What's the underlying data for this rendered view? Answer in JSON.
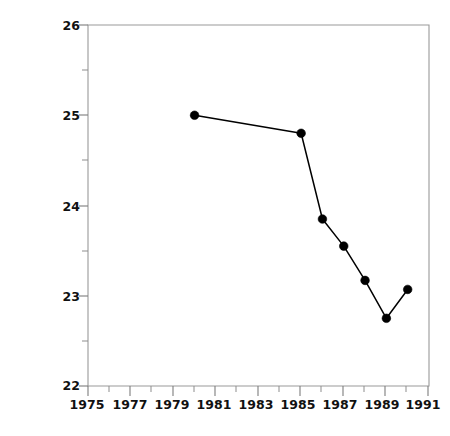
{
  "chart_data": {
    "type": "line",
    "title": "",
    "xlabel": "",
    "ylabel": "Reading test score",
    "x": [
      1980,
      1985,
      1986,
      1987,
      1988,
      1989,
      1990
    ],
    "values": [
      25.0,
      24.8,
      23.85,
      23.55,
      23.17,
      22.75,
      23.07
    ],
    "series": [
      {
        "name": "Reading test score",
        "values": [
          25.0,
          24.8,
          23.85,
          23.55,
          23.17,
          22.75,
          23.07
        ]
      }
    ],
    "xlim": [
      1975,
      1991
    ],
    "ylim": [
      22,
      26
    ],
    "xticks": [
      1975,
      1977,
      1979,
      1981,
      1983,
      1985,
      1987,
      1989,
      1991
    ],
    "xtick_labels": [
      "1975",
      "1977",
      "1979",
      "1981",
      "1983",
      "1985",
      "1987",
      "1989",
      "1991"
    ],
    "yticks": [
      22,
      23,
      24,
      25,
      26
    ],
    "ytick_labels": [
      "22",
      "23",
      "24",
      "25",
      "26"
    ],
    "x_minor_step": 1,
    "y_minor_step": 0.5,
    "grid": false,
    "legend": "none",
    "marker": "filled-circle",
    "line_color": "#000000",
    "marker_color": "#000000",
    "axis_color": "#9a9a9a",
    "background": "#ffffff"
  }
}
